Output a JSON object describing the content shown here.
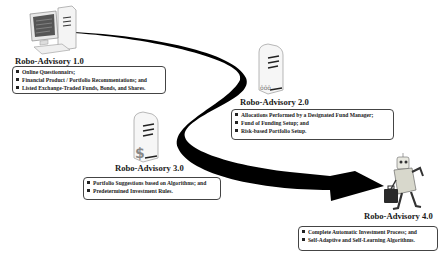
{
  "diagram": {
    "stages": [
      {
        "id": "1.0",
        "title": "Robo-Advisory 1.0",
        "icon": "desktop-computer-icon",
        "items": [
          "Online Questionnairs;",
          "Financial Product / Portfolio Recommentations; and",
          "Listed Exchange-Traded Funds, Bonds, and Shares."
        ]
      },
      {
        "id": "2.0",
        "title": "Robo-Advisory 2.0",
        "icon": "server-tower-people-icon",
        "items": [
          "Allocations Performed by a Designated Fund Manager;",
          "Fund of Funding Setup; and",
          "Risk-based Portfolio Setup."
        ]
      },
      {
        "id": "3.0",
        "title": "Robo-Advisory 3.0",
        "icon": "server-tower-dollar-icon",
        "items": [
          "Portfolio Suggestions based on Algorithms; and",
          "Predetermined Investment Rules."
        ]
      },
      {
        "id": "4.0",
        "title": "Robo-Advisory 4.0",
        "icon": "robot-with-briefcase-icon",
        "items": [
          "Complete Automatic Investment Process; and",
          "Self-Adaptive and Self-Learning Algorithms."
        ]
      }
    ],
    "connector": "curved-evolution-arrow",
    "colors": {
      "arrow": "#000000",
      "box_border": "#444444",
      "text": "#1a1a1a",
      "background": "#ffffff"
    }
  }
}
